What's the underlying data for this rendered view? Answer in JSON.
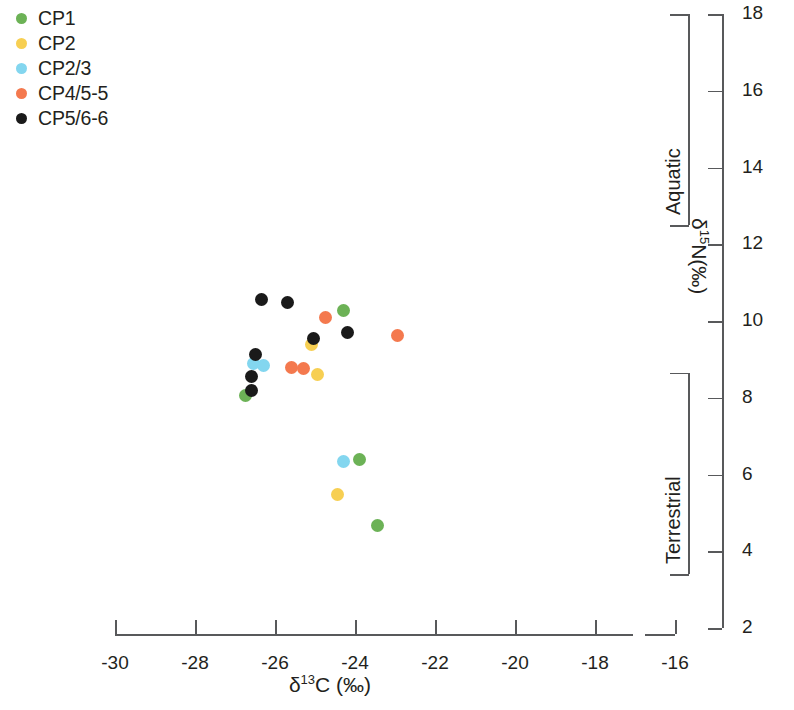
{
  "chart_data": {
    "type": "scatter",
    "title": "",
    "xlabel": "δ13C (‰)",
    "ylabel": "δ15N(‰)",
    "xlim": [
      -30.6,
      -15.6
    ],
    "ylim": [
      2,
      18
    ],
    "xticks": [
      -30,
      -28,
      -26,
      -24,
      -22,
      -20,
      -18,
      -16
    ],
    "xticklabels": [
      "-30",
      "-28",
      "-26",
      "-24",
      "-22",
      "-20",
      "-18",
      "-16"
    ],
    "yticks": [
      2,
      4,
      6,
      8,
      10,
      12,
      14,
      16,
      18
    ],
    "yticklabels": [
      "2",
      "4",
      "6",
      "8",
      "10",
      "12",
      "14",
      "16",
      "18"
    ],
    "grid": false,
    "legend_position": "top-left",
    "series": [
      {
        "name": "CP1",
        "color": "#6cb256",
        "points": [
          {
            "x": -24.28,
            "y": 10.27
          },
          {
            "x": -26.75,
            "y": 8.05
          },
          {
            "x": -23.9,
            "y": 6.38
          },
          {
            "x": -23.45,
            "y": 4.67
          }
        ]
      },
      {
        "name": "CP2",
        "color": "#f7cf52",
        "points": [
          {
            "x": -25.1,
            "y": 9.4
          },
          {
            "x": -24.95,
            "y": 8.6
          },
          {
            "x": -24.45,
            "y": 5.47
          }
        ]
      },
      {
        "name": "CP2/3",
        "color": "#83d6ef",
        "points": [
          {
            "x": -26.53,
            "y": 8.9
          },
          {
            "x": -26.28,
            "y": 8.85
          },
          {
            "x": -24.28,
            "y": 6.35
          }
        ]
      },
      {
        "name": "CP4/5-5",
        "color": "#f4794e",
        "points": [
          {
            "x": -24.75,
            "y": 10.1
          },
          {
            "x": -22.95,
            "y": 9.63
          },
          {
            "x": -25.6,
            "y": 8.78
          },
          {
            "x": -25.3,
            "y": 8.75
          }
        ]
      },
      {
        "name": "CP5/6-6",
        "color": "#1a1a1a",
        "points": [
          {
            "x": -26.35,
            "y": 10.55
          },
          {
            "x": -25.68,
            "y": 10.48
          },
          {
            "x": -24.18,
            "y": 9.7
          },
          {
            "x": -25.05,
            "y": 9.55
          },
          {
            "x": -26.48,
            "y": 9.13
          },
          {
            "x": -26.6,
            "y": 8.55
          },
          {
            "x": -26.58,
            "y": 8.18
          }
        ]
      }
    ],
    "annotations": [
      {
        "name": "Aquatic",
        "y_range": [
          12.5,
          18.0
        ]
      },
      {
        "name": "Terrestrial",
        "y_range": [
          3.4,
          8.65
        ]
      }
    ]
  },
  "legend": {
    "items": [
      {
        "label": "CP1",
        "color": "#6cb256"
      },
      {
        "label": "CP2",
        "color": "#f7cf52"
      },
      {
        "label": "CP2/3",
        "color": "#83d6ef"
      },
      {
        "label": "CP4/5-5",
        "color": "#f4794e"
      },
      {
        "label": "CP5/6-6",
        "color": "#1a1a1a"
      }
    ]
  },
  "axis_titles": {
    "x_delta": "δ",
    "x_sup": "13",
    "x_rest": "C (‰)",
    "y_delta": "δ",
    "y_sup": "15",
    "y_rest": "N(‰)"
  },
  "colors": {
    "axis": "#58595b",
    "text": "#231f20",
    "background": "#ffffff"
  }
}
